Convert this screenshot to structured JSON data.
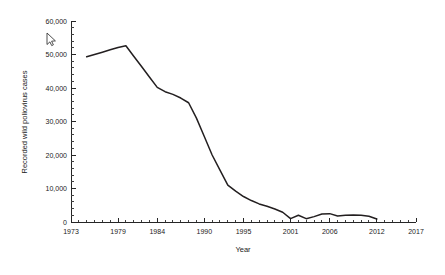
{
  "chart_data": {
    "type": "line",
    "title": "",
    "xlabel": "Year",
    "ylabel": "Recorded wild poliovirus cases",
    "xlim": [
      1973,
      2017
    ],
    "ylim": [
      0,
      60000
    ],
    "grid": false,
    "legend": null,
    "x_ticks": [
      1973,
      1979,
      1984,
      1990,
      1995,
      2001,
      2006,
      2012,
      2017
    ],
    "x_tick_labels": [
      "1973",
      "1979",
      "1984",
      "1990",
      "1995",
      "2001",
      "2006",
      "2012",
      "2017"
    ],
    "x_minor_tick_step": 1,
    "y_ticks": [
      0,
      10000,
      20000,
      30000,
      40000,
      50000,
      60000
    ],
    "y_tick_labels": [
      "0",
      "10,000",
      "20,000",
      "30,000",
      "40,000",
      "50,000",
      "60,000"
    ],
    "y_minor_tick_step": 2000,
    "line_color": "#231f20",
    "series": [
      {
        "name": "Recorded wild poliovirus cases",
        "x": [
          1975,
          1976,
          1977,
          1978,
          1979,
          1980,
          1981,
          1982,
          1983,
          1984,
          1985,
          1986,
          1987,
          1988,
          1989,
          1990,
          1991,
          1992,
          1993,
          1994,
          1995,
          1996,
          1997,
          1998,
          1999,
          2000,
          2001,
          2002,
          2003,
          2004,
          2005,
          2006,
          2007,
          2008,
          2009,
          2010,
          2011,
          2012
        ],
        "values": [
          49300,
          50000,
          50700,
          51400,
          52100,
          52600,
          49500,
          46400,
          43300,
          40200,
          38900,
          38100,
          37000,
          35600,
          31000,
          25500,
          20000,
          15500,
          11000,
          9200,
          7600,
          6400,
          5400,
          4700,
          3900,
          2900,
          1000,
          2000,
          1000,
          1600,
          2400,
          2500,
          1800,
          2000,
          2100,
          2000,
          1700,
          900
        ]
      }
    ]
  },
  "overlay": {
    "cursor_icon": "mouse-pointer-arrow",
    "cursor_x": 47,
    "cursor_y": 33
  }
}
